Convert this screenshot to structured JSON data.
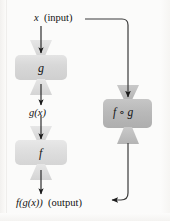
{
  "diagram": {
    "type": "flow-diagram",
    "background_color": "#fbfbfa",
    "labels": {
      "input": {
        "variable": "x",
        "annotation": "(input)"
      },
      "intermediate": {
        "text": "g(x)"
      },
      "output": {
        "expression": "f(g(x))",
        "annotation": "(output)"
      }
    },
    "nodes": [
      {
        "id": "g",
        "label": "g",
        "fill": "#d6d6d6",
        "note": "inner function box"
      },
      {
        "id": "f",
        "label": "f",
        "fill": "#dcdcdc",
        "note": "outer function box"
      },
      {
        "id": "fog",
        "label": "f ∘ g",
        "fill": "#b9b9b9",
        "note": "composite function box"
      }
    ],
    "edges": [
      {
        "from": "x",
        "to": "g",
        "label": ""
      },
      {
        "from": "g",
        "to": "g(x)",
        "label": ""
      },
      {
        "from": "g(x)",
        "to": "f",
        "label": ""
      },
      {
        "from": "f",
        "to": "f(g(x))",
        "label": ""
      },
      {
        "from": "x",
        "to": "fog",
        "label": ""
      },
      {
        "from": "fog",
        "to": "f(g(x))",
        "label": ""
      }
    ],
    "colors": {
      "arrow": "#1a1a1a",
      "connector": "#3a3a3a",
      "box_light": "#dcdcdc",
      "box_mid": "#d6d6d6",
      "box_dark": "#b9b9b9",
      "funnel": "#dcdcdc",
      "text": "#111111"
    }
  }
}
